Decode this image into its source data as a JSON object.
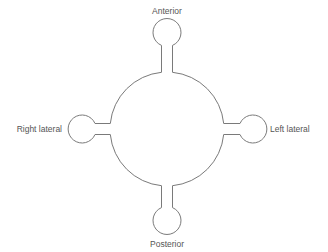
{
  "diagram": {
    "type": "well-with-four-lobes",
    "colors": {
      "stroke": "#7a7a7a",
      "text": "#555555",
      "background": "#ffffff"
    },
    "center_chamber": {
      "cx": 167,
      "cy": 129,
      "r": 57
    },
    "lobes": [
      {
        "id": "anterior",
        "label": "Anterior",
        "direction": "top"
      },
      {
        "id": "left-lateral",
        "label": "Left lateral",
        "direction": "right"
      },
      {
        "id": "posterior",
        "label": "Posterior",
        "direction": "bottom"
      },
      {
        "id": "right-lateral",
        "label": "Right lateral",
        "direction": "left"
      }
    ]
  }
}
